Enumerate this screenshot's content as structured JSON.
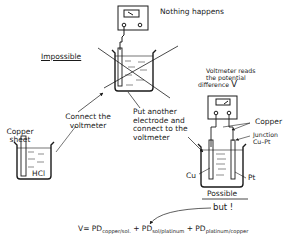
{
  "diagram": {
    "top_scenario": {
      "result_label": "Nothing happens",
      "status_label": "Impossible",
      "crossed_out": true
    },
    "left_scenario": {
      "electrode_label_line1": "Copper",
      "electrode_label_line2": "sheet",
      "solution_label": "HCl"
    },
    "steps": {
      "connect_line1": "Connect the",
      "connect_line2": "voltmeter",
      "another_line1": "Put another",
      "another_line2": "electrode and",
      "another_line3": "connect to the",
      "another_line4": "voltmeter"
    },
    "right_scenario": {
      "reading_line1": "Voltmeter reads",
      "reading_line2": "the potential",
      "reading_line3": "difference",
      "reading_symbol": "V",
      "wire_label": "Copper",
      "junction_line1": "Junction",
      "junction_line2": "Cu–Pt",
      "left_electrode": "Cu",
      "right_electrode": "Pt",
      "status_label": "Possible",
      "caveat": "but !"
    },
    "equation": {
      "lhs": "V=",
      "term1": "PD",
      "term1_sub": "copper/sol.",
      "plus1": "+",
      "term2": "PD",
      "term2_sub": "sol/platinum",
      "plus2": "+",
      "term3": "PD",
      "term3_sub": "platinum/copper"
    },
    "colors": {
      "ink": "#1a1a1a",
      "background": "#ffffff"
    }
  }
}
